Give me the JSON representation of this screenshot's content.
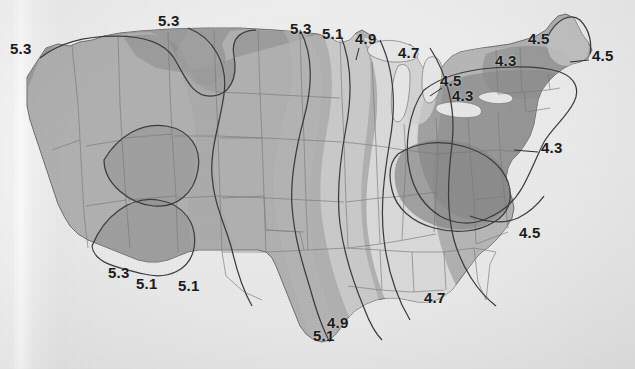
{
  "map": {
    "title": "Contour (isopleth) map of the contiguous United States",
    "description": "Scanned grayscale isopleth map showing values decreasing from west (5.3) to east (4.3), with shaded bands between contour lines.",
    "units_note": "",
    "background_color": "#e9e9e9",
    "label_color": "#1b1b1b",
    "contour_line_color": "#3a3a3a",
    "state_border_color": "#7d7d7d",
    "shade_palette": {
      "band_5_3_plus": "#8e8e8e",
      "band_5_1_5_3": "#a0a0a0",
      "band_4_9_5_1": "#b5b5b5",
      "band_4_7_4_9": "#cccccc",
      "band_4_5_4_7": "#e2e2e2",
      "band_4_3_4_5": "#b9b9b9",
      "band_4_3_minus": "#848484",
      "lakes": "#e5e5e5"
    },
    "contour_values": [
      "5.3",
      "5.1",
      "4.9",
      "4.7",
      "4.5",
      "4.3"
    ],
    "labels": [
      {
        "id": "lbl-w-53",
        "text": "5.3",
        "x": 10,
        "y": 48,
        "region": "pacific-northwest-west"
      },
      {
        "id": "lbl-n-53",
        "text": "5.3",
        "x": 158,
        "y": 20,
        "region": "northern-plains-top"
      },
      {
        "id": "lbl-nc-53",
        "text": "5.3",
        "x": 290,
        "y": 28,
        "region": "upper-midwest-top"
      },
      {
        "id": "lbl-nc-51",
        "text": "5.1",
        "x": 322,
        "y": 33,
        "region": "minnesota-top"
      },
      {
        "id": "lbl-nc-49",
        "text": "4.9",
        "x": 355,
        "y": 38,
        "region": "minnesota-northeast"
      },
      {
        "id": "lbl-nc-47",
        "text": "4.7",
        "x": 398,
        "y": 52,
        "region": "wisconsin-north"
      },
      {
        "id": "lbl-gl-45",
        "text": "4.5",
        "x": 440,
        "y": 80,
        "region": "michigan-lower"
      },
      {
        "id": "lbl-gl-43",
        "text": "4.3",
        "x": 452,
        "y": 95,
        "region": "michigan-southeast"
      },
      {
        "id": "lbl-ne-43",
        "text": "4.3",
        "x": 495,
        "y": 60,
        "region": "new-york-north"
      },
      {
        "id": "lbl-me-45a",
        "text": "4.5",
        "x": 528,
        "y": 38,
        "region": "maine-west"
      },
      {
        "id": "lbl-me-45b",
        "text": "4.5",
        "x": 592,
        "y": 55,
        "region": "maine-east-coast"
      },
      {
        "id": "lbl-mid-43",
        "text": "4.3",
        "x": 541,
        "y": 147,
        "region": "virginia-coast"
      },
      {
        "id": "lbl-se-45",
        "text": "4.5",
        "x": 519,
        "y": 232,
        "region": "south-carolina"
      },
      {
        "id": "lbl-gulf-47",
        "text": "4.7",
        "x": 424,
        "y": 297,
        "region": "gulf-coast-mississippi"
      },
      {
        "id": "lbl-sw-53",
        "text": "5.3",
        "x": 108,
        "y": 272,
        "region": "arizona-south"
      },
      {
        "id": "lbl-sw-51",
        "text": "5.1",
        "x": 136,
        "y": 283,
        "region": "new-mexico-southwest"
      },
      {
        "id": "lbl-sc-51",
        "text": "5.1",
        "x": 178,
        "y": 285,
        "region": "new-mexico-southeast"
      },
      {
        "id": "lbl-tx-49",
        "text": "4.9",
        "x": 327,
        "y": 322,
        "region": "texas-gulf-upper"
      },
      {
        "id": "lbl-tx-51",
        "text": "5.1",
        "x": 313,
        "y": 335,
        "region": "texas-gulf-lower"
      }
    ],
    "leader_lines": [
      {
        "id": "leader-virginia",
        "from_x": 538,
        "from_y": 152,
        "to_x": 516,
        "to_y": 150
      },
      {
        "id": "leader-maine",
        "from_x": 589,
        "from_y": 60,
        "to_x": 571,
        "to_y": 62
      },
      {
        "id": "leader-minn",
        "from_x": 358,
        "from_y": 48,
        "to_x": 355,
        "to_y": 60
      }
    ]
  }
}
